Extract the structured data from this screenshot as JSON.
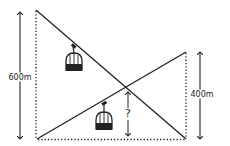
{
  "diagram": {
    "colors": {
      "stroke": "#222222",
      "background": "#ffffff"
    },
    "labels": {
      "left_height": "600m",
      "right_height": "400m",
      "unknown_height": "?"
    },
    "elements": {
      "cable_descending": {
        "from": [
          36,
          10
        ],
        "to": [
          186,
          139
        ]
      },
      "cable_ascending": {
        "from": [
          37,
          139
        ],
        "to": [
          186,
          52
        ]
      },
      "left_tower_dotted": {
        "x": 36,
        "y1": 10,
        "y2": 139
      },
      "right_tower_dotted": {
        "x": 186,
        "y1": 52,
        "y2": 139
      },
      "ground_dotted": {
        "y": 139,
        "x1": 37,
        "x2": 186
      },
      "left_arrow": {
        "x": 20,
        "y1": 11,
        "y2": 140
      },
      "right_arrow": {
        "x": 200,
        "y1": 51,
        "y2": 140
      },
      "middle_arrow": {
        "x": 128,
        "y1": 90,
        "y2": 137
      },
      "gondola_1": {
        "x": 74,
        "y": 60
      },
      "gondola_2": {
        "x": 104,
        "y": 120
      },
      "crossing_point": [
        128,
        89
      ]
    }
  }
}
